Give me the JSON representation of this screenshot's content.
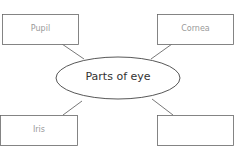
{
  "diagram": {
    "title": "Parts of eye",
    "nodes": [
      {
        "id": "top-left",
        "label": "Pupil"
      },
      {
        "id": "top-right",
        "label": "Cornea"
      },
      {
        "id": "bottom-left",
        "label": "Iris"
      },
      {
        "id": "bottom-right",
        "label": ""
      }
    ],
    "colors": {
      "stroke": "#555555",
      "box_text": "#9a9a9a",
      "center_text": "#333333"
    }
  }
}
